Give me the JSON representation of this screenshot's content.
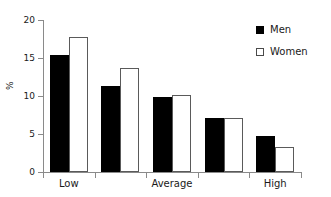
{
  "chart_data": {
    "type": "bar",
    "title": "",
    "subtitle": "",
    "xlabel": "",
    "ylabel": "%",
    "ylim": [
      0,
      20
    ],
    "yticks": [
      0,
      5,
      10,
      15,
      20
    ],
    "ytick_labels": [
      "0",
      "5",
      "10",
      "15",
      "20"
    ],
    "grid": false,
    "categories": [
      "Low",
      "",
      "Average",
      "",
      "High"
    ],
    "xtick_labels": [
      "Low",
      "Average",
      "High"
    ],
    "legend_position": "top-right",
    "series": [
      {
        "name": "Men",
        "color": "#000000",
        "fill": "solid",
        "values": [
          15.4,
          11.3,
          9.9,
          7.1,
          4.7
        ]
      },
      {
        "name": "Women",
        "color": "#ffffff",
        "fill": "open",
        "values": [
          17.8,
          13.7,
          10.1,
          7.1,
          3.3
        ]
      }
    ]
  },
  "legend": {
    "items": [
      {
        "label": "Men",
        "swatch": "filled-square-icon"
      },
      {
        "label": "Women",
        "swatch": "open-square-icon"
      }
    ]
  },
  "axes": {
    "y_title": "%",
    "y_tick_labels": [
      "20",
      "15",
      "10",
      "5",
      "0"
    ],
    "x_tick_labels": [
      "Low",
      "Average",
      "High"
    ]
  },
  "colors": {
    "men": "#000000",
    "women": "#ffffff",
    "women_outline": "#5a5a5a",
    "axis": "#8a8a8a",
    "text": "#1a1a1a",
    "background": "#ffffff"
  }
}
